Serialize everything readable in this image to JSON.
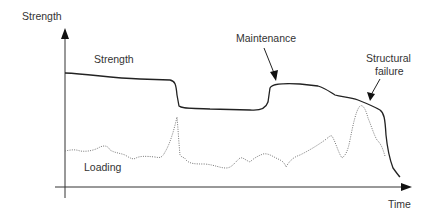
{
  "diagram": {
    "y_axis_label": "Strength",
    "x_axis_label": "Time",
    "labels": {
      "strength_curve": "Strength",
      "loading_curve": "Loading",
      "maintenance": "Maintenance",
      "failure_line1": "Structural",
      "failure_line2": "failure"
    },
    "colors": {
      "strength": "#222222",
      "loading": "#777777",
      "axes": "#333333",
      "text": "#333333"
    },
    "curves": {
      "strength": "M65,73 C90,74 110,78 140,79 L170,80 C175,81 176,84 177,95 L179,106 C182,109 190,108 210,109 L250,110 C260,111 266,108 268,102 L270,88 C272,84 280,83 300,84 L318,86 C325,88 330,92 335,95 C342,97 350,97 358,100 C368,104 375,107 380,110 C384,113 385,118 386,135 C387,145 390,160 393,168 C396,172 398,175 400,177",
      "loading": "M65,151 C70,150 75,149 80,151 C88,152 95,150 100,147 C105,145 108,146 110,150 C115,153 120,153 125,155 C130,158 133,160 136,158 C140,156 145,156 155,157 C160,158 162,158 165,152 C170,144 174,130 177,117 C178,128 179,145 180,155 C182,158 185,157 186,160 C190,164 195,164 205,164 C215,165 220,168 226,168 C232,168 235,162 240,158 C243,157 245,160 250,162 C254,158 258,156 263,154 C268,153 272,156 276,158 C280,160 284,161 286,167 C290,160 294,157 300,155 C310,150 318,145 325,140 C328,138 330,135 332,136 C336,143 338,152 342,158 C346,155 348,150 350,140 C353,125 356,110 360,106 C363,104 366,110 368,118 C371,125 374,135 377,140 C382,145 383,150 385,156"
    },
    "strength_curve_points": [
      {
        "x": 65,
        "y": 73
      },
      {
        "x": 170,
        "y": 80
      },
      {
        "x": 178,
        "y": 108
      },
      {
        "x": 268,
        "y": 110
      },
      {
        "x": 272,
        "y": 84
      },
      {
        "x": 330,
        "y": 90
      },
      {
        "x": 380,
        "y": 110
      },
      {
        "x": 400,
        "y": 177
      }
    ],
    "loading_curve_points": [
      {
        "x": 65,
        "y": 151
      },
      {
        "x": 103,
        "y": 146
      },
      {
        "x": 136,
        "y": 158
      },
      {
        "x": 177,
        "y": 117
      },
      {
        "x": 180,
        "y": 155
      },
      {
        "x": 226,
        "y": 168
      },
      {
        "x": 332,
        "y": 136
      },
      {
        "x": 342,
        "y": 158
      },
      {
        "x": 360,
        "y": 106
      },
      {
        "x": 385,
        "y": 156
      }
    ]
  }
}
